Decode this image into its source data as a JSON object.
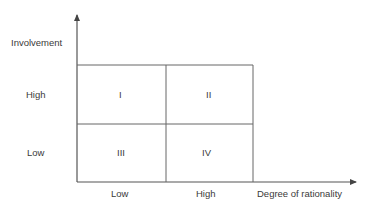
{
  "diagram": {
    "y_axis_label": "Involvement",
    "x_axis_label": "Degree of rationality",
    "y_levels": [
      "High",
      "Low"
    ],
    "x_levels": [
      "Low",
      "High"
    ],
    "quadrants": [
      {
        "id": "I",
        "involvement": "High",
        "rationality": "Low"
      },
      {
        "id": "II",
        "involvement": "High",
        "rationality": "High"
      },
      {
        "id": "III",
        "involvement": "Low",
        "rationality": "Low"
      },
      {
        "id": "IV",
        "involvement": "Low",
        "rationality": "High"
      }
    ],
    "line_color": "#555555"
  }
}
